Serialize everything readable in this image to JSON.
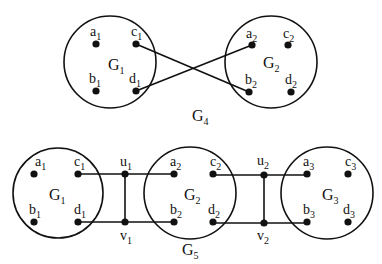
{
  "colors": {
    "stroke": "#111111",
    "node": "#111111",
    "background": "#ffffff"
  },
  "top": {
    "caption": {
      "base": "G",
      "sub": "4",
      "x": 192,
      "y": 121
    },
    "groups": [
      {
        "id": "G1",
        "base": "G",
        "sub": "1",
        "cx": 110,
        "cy": 62,
        "r": 46,
        "lx": 108,
        "ly": 70,
        "nodes": [
          {
            "id": "a1",
            "base": "a",
            "sub": "1",
            "x": 96,
            "y": 44,
            "lx": 90,
            "ly": 36
          },
          {
            "id": "c1",
            "base": "c",
            "sub": "1",
            "x": 136,
            "y": 44,
            "lx": 131,
            "ly": 36
          },
          {
            "id": "b1",
            "base": "b",
            "sub": "1",
            "x": 96,
            "y": 91,
            "lx": 89,
            "ly": 83
          },
          {
            "id": "d1",
            "base": "d",
            "sub": "1",
            "x": 136,
            "y": 91,
            "lx": 129,
            "ly": 83
          }
        ]
      },
      {
        "id": "G2",
        "base": "G",
        "sub": "2",
        "cx": 271,
        "cy": 62,
        "r": 46,
        "lx": 263,
        "ly": 68,
        "nodes": [
          {
            "id": "a2",
            "base": "a",
            "sub": "2",
            "x": 252,
            "y": 45,
            "lx": 246,
            "ly": 38
          },
          {
            "id": "c2",
            "base": "c",
            "sub": "2",
            "x": 288,
            "y": 45,
            "lx": 283,
            "ly": 38
          },
          {
            "id": "b2",
            "base": "b",
            "sub": "2",
            "x": 249,
            "y": 92,
            "lx": 245,
            "ly": 84
          },
          {
            "id": "d2",
            "base": "d",
            "sub": "2",
            "x": 291,
            "y": 92,
            "lx": 285,
            "ly": 84
          }
        ]
      }
    ],
    "edges": [
      {
        "from": "c1",
        "to": "b2",
        "x1": 136,
        "y1": 44,
        "x2": 249,
        "y2": 92
      },
      {
        "from": "d1",
        "to": "a2",
        "x1": 136,
        "y1": 91,
        "x2": 252,
        "y2": 45
      }
    ]
  },
  "bottom": {
    "caption": {
      "base": "G",
      "sub": "5",
      "x": 182,
      "y": 255
    },
    "groups": [
      {
        "id": "G1",
        "base": "G",
        "sub": "1",
        "cx": 58,
        "cy": 193,
        "r": 45,
        "lx": 49,
        "ly": 200,
        "nodes": [
          {
            "id": "a1",
            "base": "a",
            "sub": "1",
            "x": 34,
            "y": 174,
            "lx": 35,
            "ly": 166
          },
          {
            "id": "c1",
            "base": "c",
            "sub": "1",
            "x": 78,
            "y": 174,
            "lx": 74,
            "ly": 166
          },
          {
            "id": "b1",
            "base": "b",
            "sub": "1",
            "x": 34,
            "y": 222,
            "lx": 29,
            "ly": 214
          },
          {
            "id": "d1",
            "base": "d",
            "sub": "1",
            "x": 78,
            "y": 222,
            "lx": 74,
            "ly": 214
          }
        ]
      },
      {
        "id": "G2",
        "base": "G",
        "sub": "2",
        "cx": 190,
        "cy": 193,
        "r": 46,
        "lx": 184,
        "ly": 200,
        "nodes": [
          {
            "id": "a2",
            "base": "a",
            "sub": "2",
            "x": 174,
            "y": 174,
            "lx": 170,
            "ly": 166
          },
          {
            "id": "c2",
            "base": "c",
            "sub": "2",
            "x": 213,
            "y": 174,
            "lx": 210,
            "ly": 166
          },
          {
            "id": "b2",
            "base": "b",
            "sub": "2",
            "x": 174,
            "y": 222,
            "lx": 170,
            "ly": 214
          },
          {
            "id": "d2",
            "base": "d",
            "sub": "2",
            "x": 213,
            "y": 222,
            "lx": 208,
            "ly": 214
          }
        ]
      },
      {
        "id": "G3",
        "base": "G",
        "sub": "3",
        "cx": 327,
        "cy": 193,
        "r": 46,
        "lx": 322,
        "ly": 200,
        "nodes": [
          {
            "id": "a3",
            "base": "a",
            "sub": "3",
            "x": 307,
            "y": 174,
            "lx": 303,
            "ly": 166
          },
          {
            "id": "c3",
            "base": "c",
            "sub": "3",
            "x": 348,
            "y": 174,
            "lx": 345,
            "ly": 166
          },
          {
            "id": "b3",
            "base": "b",
            "sub": "3",
            "x": 307,
            "y": 222,
            "lx": 303,
            "ly": 214
          },
          {
            "id": "d3",
            "base": "d",
            "sub": "3",
            "x": 348,
            "y": 222,
            "lx": 343,
            "ly": 214
          }
        ]
      }
    ],
    "connectors": [
      {
        "id": "u1",
        "base": "u",
        "sub": "1",
        "x": 125,
        "y": 174,
        "lx": 120,
        "ly": 166
      },
      {
        "id": "v1",
        "base": "v",
        "sub": "1",
        "x": 125,
        "y": 222,
        "lx": 120,
        "ly": 240
      },
      {
        "id": "u2",
        "base": "u",
        "sub": "2",
        "x": 264,
        "y": 175,
        "lx": 257,
        "ly": 165
      },
      {
        "id": "v2",
        "base": "v",
        "sub": "2",
        "x": 264,
        "y": 223,
        "lx": 257,
        "ly": 240
      }
    ],
    "edges": [
      {
        "x1": 78,
        "y1": 174,
        "x2": 174,
        "y2": 174
      },
      {
        "x1": 78,
        "y1": 222,
        "x2": 174,
        "y2": 222
      },
      {
        "x1": 125,
        "y1": 174,
        "x2": 125,
        "y2": 222
      },
      {
        "x1": 213,
        "y1": 175,
        "x2": 307,
        "y2": 175
      },
      {
        "x1": 213,
        "y1": 223,
        "x2": 307,
        "y2": 223
      },
      {
        "x1": 264,
        "y1": 175,
        "x2": 264,
        "y2": 223
      }
    ]
  }
}
